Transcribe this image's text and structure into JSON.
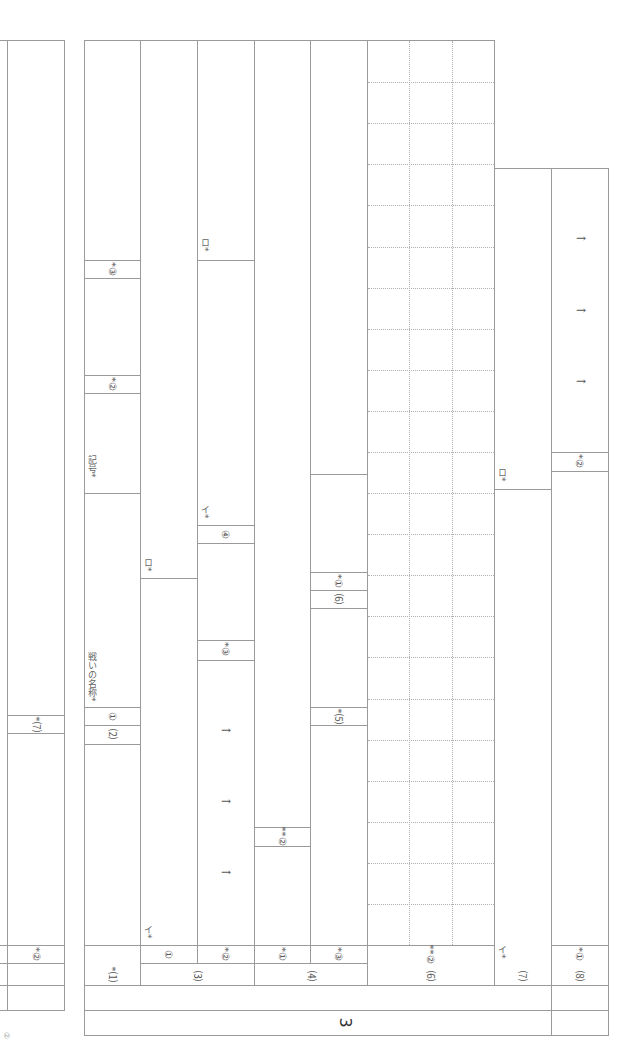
{
  "section": {
    "number": "3"
  },
  "left_partial_column": {
    "labels": [
      {
        "id": "q7",
        "text": "*⑺"
      },
      {
        "id": "q2",
        "text": "*②"
      }
    ]
  },
  "columns": {
    "c1": {
      "footer": "*⑴",
      "labels": [
        {
          "id": "war-name",
          "text": "戦いの名称*"
        },
        {
          "id": "sub1",
          "text": "①"
        },
        {
          "id": "sub2",
          "text": "⑵"
        },
        {
          "id": "symbol",
          "text": "記号*"
        },
        {
          "id": "star2",
          "text": "*②"
        },
        {
          "id": "star3",
          "text": "*③"
        }
      ]
    },
    "c3": {
      "group": "⑶",
      "sub": [
        {
          "id": "c3-1",
          "footer": "①",
          "marks": [
            "イ*",
            "ロ*"
          ]
        },
        {
          "id": "c3-2",
          "footer": "*②",
          "labels": [
            "*③",
            "④",
            "イ*",
            "ロ*"
          ],
          "arrows": [
            "→",
            "→",
            "→"
          ]
        }
      ]
    },
    "c4": {
      "group": "⑷",
      "sub": [
        {
          "id": "c4-1",
          "footer": "*①",
          "labels": [
            "**②"
          ]
        },
        {
          "id": "c4-3",
          "footer": "*③",
          "labels": [
            "*⑸",
            "⑹",
            "*①"
          ]
        }
      ]
    },
    "c6": {
      "group": "⑹",
      "footer": "**②",
      "grid": {
        "cols": 3,
        "rows": 22
      }
    },
    "c7": {
      "group": "⑺",
      "marks": [
        "イ*",
        "ロ*"
      ]
    },
    "c8": {
      "group": "⑻",
      "footer": "*①",
      "labels": [
        "*②"
      ],
      "arrows": [
        "→",
        "→",
        "→"
      ]
    }
  },
  "corner_mark": "②"
}
